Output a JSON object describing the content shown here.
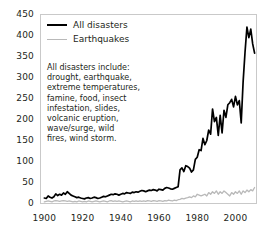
{
  "chart_data": {
    "type": "line",
    "title": "",
    "xlabel": "",
    "ylabel": "",
    "xlim": [
      1898,
      2011
    ],
    "ylim": [
      0,
      450
    ],
    "grid": false,
    "legend_position": "top-left",
    "yticks": [
      "0",
      "50",
      "100",
      "150",
      "200",
      "250",
      "300",
      "350",
      "400",
      "450"
    ],
    "ytick_values": [
      0,
      50,
      100,
      150,
      200,
      250,
      300,
      350,
      400,
      450
    ],
    "xticks": [
      "1900",
      "1920",
      "1940",
      "1960",
      "1980",
      "2000"
    ],
    "xtick_values": [
      1900,
      1920,
      1940,
      1960,
      1980,
      2000
    ],
    "x": [
      1900,
      1901,
      1902,
      1903,
      1904,
      1905,
      1906,
      1907,
      1908,
      1909,
      1910,
      1911,
      1912,
      1913,
      1914,
      1915,
      1916,
      1917,
      1918,
      1919,
      1920,
      1921,
      1922,
      1923,
      1924,
      1925,
      1926,
      1927,
      1928,
      1929,
      1930,
      1931,
      1932,
      1933,
      1934,
      1935,
      1936,
      1937,
      1938,
      1939,
      1940,
      1941,
      1942,
      1943,
      1944,
      1945,
      1946,
      1947,
      1948,
      1949,
      1950,
      1951,
      1952,
      1953,
      1954,
      1955,
      1956,
      1957,
      1958,
      1959,
      1960,
      1961,
      1962,
      1963,
      1964,
      1965,
      1966,
      1967,
      1968,
      1969,
      1970,
      1971,
      1972,
      1973,
      1974,
      1975,
      1976,
      1977,
      1978,
      1979,
      1980,
      1981,
      1982,
      1983,
      1984,
      1985,
      1986,
      1987,
      1988,
      1989,
      1990,
      1991,
      1992,
      1993,
      1994,
      1995,
      1996,
      1997,
      1998,
      1999,
      2000,
      2001,
      2002,
      2003,
      2004,
      2005,
      2006,
      2007,
      2008,
      2009,
      2010
    ],
    "series": [
      {
        "name": "All disasters",
        "color": "#000000",
        "values": [
          13,
          12,
          18,
          15,
          13,
          16,
          23,
          19,
          22,
          20,
          25,
          22,
          28,
          24,
          20,
          18,
          16,
          14,
          15,
          13,
          12,
          11,
          13,
          14,
          12,
          13,
          15,
          14,
          12,
          13,
          15,
          17,
          16,
          18,
          20,
          22,
          21,
          23,
          22,
          20,
          22,
          24,
          23,
          26,
          25,
          24,
          27,
          26,
          28,
          27,
          29,
          31,
          30,
          28,
          30,
          32,
          31,
          33,
          32,
          30,
          34,
          33,
          32,
          36,
          38,
          37,
          35,
          34,
          36,
          38,
          40,
          80,
          85,
          76,
          90,
          88,
          84,
          75,
          80,
          105,
          110,
          128,
          126,
          155,
          140,
          150,
          175,
          165,
          225,
          195,
          205,
          162,
          210,
          168,
          222,
          205,
          235,
          240,
          248,
          230,
          255,
          235,
          245,
          192,
          290,
          360,
          420,
          395,
          415,
          380,
          358
        ]
      },
      {
        "name": "Earthquakes",
        "color": "#b9b9b9",
        "values": [
          4,
          5,
          6,
          5,
          4,
          6,
          7,
          6,
          5,
          6,
          7,
          6,
          5,
          6,
          5,
          4,
          5,
          4,
          6,
          5,
          4,
          5,
          4,
          6,
          5,
          4,
          5,
          6,
          5,
          4,
          5,
          6,
          5,
          4,
          6,
          7,
          5,
          6,
          5,
          6,
          5,
          4,
          5,
          6,
          5,
          4,
          6,
          5,
          6,
          5,
          6,
          5,
          6,
          5,
          7,
          6,
          5,
          7,
          6,
          5,
          7,
          6,
          5,
          7,
          6,
          8,
          7,
          6,
          8,
          7,
          9,
          10,
          12,
          11,
          13,
          14,
          16,
          14,
          18,
          16,
          22,
          20,
          18,
          20,
          22,
          18,
          26,
          22,
          28,
          24,
          30,
          22,
          28,
          24,
          30,
          26,
          22,
          18,
          26,
          22,
          28,
          24,
          30,
          22,
          30,
          26,
          32,
          28,
          33,
          30,
          38
        ]
      }
    ],
    "annotation": {
      "lines": [
        "All disasters include:",
        "drought, earthquake,",
        "extreme temperatures,",
        "famine, food, insect",
        "infestation, slides,",
        "volcanic eruption,",
        "wave/surge, wild",
        "fires, wind storm."
      ]
    }
  }
}
